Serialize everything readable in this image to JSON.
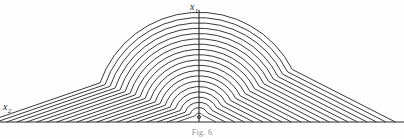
{
  "figure": {
    "caption": "Fig. 6",
    "background_color": "#fefefe",
    "line_color": "#3a3a3a",
    "axis_color": "#2b2b2b"
  },
  "labels": {
    "vertical_axis": "x",
    "vertical_axis_subscript": "1",
    "horizontal_axis": "x",
    "horizontal_axis_subscript": "2"
  },
  "chart_data": {
    "type": "line",
    "title": "Fig. 6",
    "xlabel": "x2",
    "ylabel": "x1",
    "grid": false,
    "legend": null,
    "focus_point": {
      "x": 199,
      "y": 117
    },
    "baseline_y": 122,
    "vertical_axis_x": 199,
    "vertical_axis_top": 10,
    "plot_width": 404,
    "plot_height": 139,
    "contour_count": 20,
    "radius_step": 5.3,
    "first_radius": 4.0,
    "left_slope_deg": 19,
    "right_slope_deg": 27,
    "left_foot_x": 22,
    "right_foot_x": 378,
    "crown_top_y": 14,
    "radii": [
      4.0,
      9.3,
      14.6,
      19.9,
      25.2,
      30.5,
      35.8,
      41.1,
      46.4,
      51.7,
      57.0,
      62.3,
      67.6,
      72.9,
      78.2,
      83.5,
      88.8,
      94.1,
      99.4,
      104.7
    ],
    "series": [
      {
        "name": "contour-1",
        "radius": 4.0
      },
      {
        "name": "contour-2",
        "radius": 9.3
      },
      {
        "name": "contour-3",
        "radius": 14.6
      },
      {
        "name": "contour-4",
        "radius": 19.9
      },
      {
        "name": "contour-5",
        "radius": 25.2
      },
      {
        "name": "contour-6",
        "radius": 30.5
      },
      {
        "name": "contour-7",
        "radius": 35.8
      },
      {
        "name": "contour-8",
        "radius": 41.1
      },
      {
        "name": "contour-9",
        "radius": 46.4
      },
      {
        "name": "contour-10",
        "radius": 51.7
      },
      {
        "name": "contour-11",
        "radius": 57.0
      },
      {
        "name": "contour-12",
        "radius": 62.3
      },
      {
        "name": "contour-13",
        "radius": 67.6
      },
      {
        "name": "contour-14",
        "radius": 72.9
      },
      {
        "name": "contour-15",
        "radius": 78.2
      },
      {
        "name": "contour-16",
        "radius": 83.5
      },
      {
        "name": "contour-17",
        "radius": 88.8
      },
      {
        "name": "contour-18",
        "radius": 94.1
      },
      {
        "name": "contour-19",
        "radius": 99.4
      },
      {
        "name": "contour-20",
        "radius": 104.7
      }
    ]
  }
}
